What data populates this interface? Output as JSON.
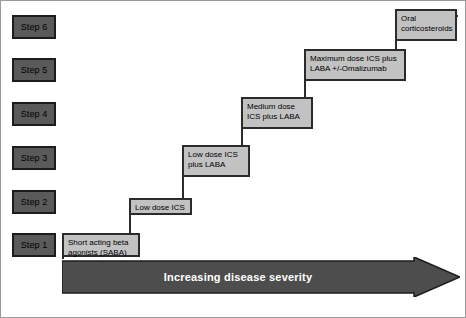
{
  "diagram": {
    "colors": {
      "step_fill": "#5a5a5a",
      "step_border": "#1c1c1c",
      "box_fill": "#c2c2c2",
      "box_border": "#2b2b2b",
      "arrow_fill": "#4d4d4d",
      "arrow_text": "#ffffff",
      "background": "#ffffff"
    },
    "steps": [
      {
        "label": "Step 6"
      },
      {
        "label": "Step 5"
      },
      {
        "label": "Step 4"
      },
      {
        "label": "Step 3"
      },
      {
        "label": "Step 2"
      },
      {
        "label": "Step 1"
      }
    ],
    "treatments": [
      {
        "step": "Step 6",
        "lines": [
          "Oral",
          "corticosteroids"
        ]
      },
      {
        "step": "Step 5",
        "lines": [
          "Maximum dose ICS plus",
          "LABA +/-Omalizumab"
        ]
      },
      {
        "step": "Step 4",
        "lines": [
          "Medium dose",
          "ICS plus LABA"
        ]
      },
      {
        "step": "Step 3",
        "lines": [
          "Low dose ICS",
          "plus LABA"
        ]
      },
      {
        "step": "Step 2",
        "lines": [
          "Low dose ICS"
        ]
      },
      {
        "step": "Step 1",
        "lines": [
          "Short acting beta",
          "agonists (SABA)"
        ]
      }
    ],
    "arrow": {
      "label": "Increasing disease severity",
      "direction": "right"
    }
  }
}
